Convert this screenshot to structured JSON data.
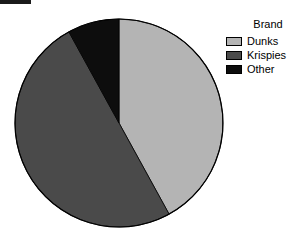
{
  "chart_data": {
    "type": "pie",
    "title": "",
    "legend_title": "Brand",
    "legend_position": "right",
    "categories": [
      "Dunks",
      "Krispies",
      "Other"
    ],
    "values": [
      42,
      50,
      8
    ],
    "unit": "percent",
    "slice_colors": [
      "#b4b4b4",
      "#4a4a4a",
      "#0d0d0d"
    ],
    "start_angle_deg": 0,
    "direction": "clockwise",
    "slice_angles_deg": [
      151,
      180,
      29
    ],
    "xlabel": "",
    "ylabel": "",
    "grid": false,
    "labels_shown": false
  },
  "legend": {
    "title": "Brand",
    "items": [
      {
        "label": "Dunks",
        "color": "#b4b4b4"
      },
      {
        "label": "Krispies",
        "color": "#4a4a4a"
      },
      {
        "label": "Other",
        "color": "#0d0d0d"
      }
    ]
  },
  "colors": {
    "background": "#ffffff",
    "outline": "#000000",
    "marker_bar": "#1a1a1a"
  }
}
